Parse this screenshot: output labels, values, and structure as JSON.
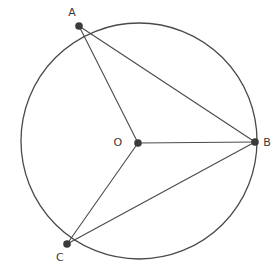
{
  "figure": {
    "type": "circle-geometry-diagram",
    "background_color": "#ffffff",
    "stroke_color": "#4a4a4a",
    "point_color": "#3a3a3a",
    "label_color": "#3a3a3a",
    "circle": {
      "name": "circle-outline",
      "center_x": 139,
      "center_y": 141,
      "radius": 118,
      "stroke_width": 1.3
    },
    "points": [
      {
        "id": "A",
        "label": "A",
        "x": 79,
        "y": 26,
        "label_x": 72,
        "label_y": 13,
        "radius": 3.8
      },
      {
        "id": "O",
        "label": "O",
        "x": 138,
        "y": 143,
        "label_x": 118,
        "label_y": 143,
        "radius": 3.8
      },
      {
        "id": "B",
        "label": "B",
        "x": 255,
        "y": 142,
        "label_x": 267,
        "label_y": 143,
        "radius": 3.8
      },
      {
        "id": "C",
        "label": "C",
        "x": 67,
        "y": 244,
        "label_x": 60,
        "label_y": 258,
        "radius": 3.8
      }
    ],
    "segments": [
      {
        "id": "OA",
        "name": "radius-o-a",
        "x1": 138,
        "y1": 143,
        "x2": 79,
        "y2": 26
      },
      {
        "id": "OB",
        "name": "radius-o-b",
        "x1": 138,
        "y1": 143,
        "x2": 255,
        "y2": 142
      },
      {
        "id": "OC",
        "name": "radius-o-c",
        "x1": 138,
        "y1": 143,
        "x2": 67,
        "y2": 244
      },
      {
        "id": "AB",
        "name": "chord-a-b",
        "x1": 79,
        "y1": 26,
        "x2": 255,
        "y2": 142
      },
      {
        "id": "CB",
        "name": "chord-c-b",
        "x1": 67,
        "y1": 244,
        "x2": 255,
        "y2": 142
      }
    ],
    "labels": {
      "A": "A",
      "B": "B",
      "C": "C",
      "O": "O"
    }
  }
}
